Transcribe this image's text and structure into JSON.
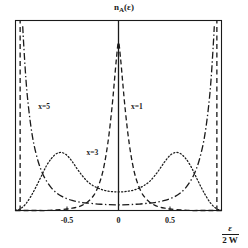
{
  "figure": {
    "title_main": "n",
    "title_sub": "A",
    "title_arg": "(ε)",
    "background_color": "#ffffff",
    "axis_color": "#1a1a1a"
  },
  "axes": {
    "xlabel_numerator": "ε",
    "xlabel_denominator": "2 W",
    "xtick_labels": [
      "-0.5",
      "0",
      "0.5"
    ],
    "xtick_values": [
      -0.5,
      0,
      0.5
    ],
    "ylabel": ""
  },
  "curve_labels": [
    {
      "text": "x=5",
      "id": "label-x5"
    },
    {
      "text": "x=3",
      "id": "label-x3"
    },
    {
      "text": "x=1",
      "id": "label-x1"
    }
  ],
  "chart_data": {
    "type": "line",
    "xlabel": "ε / 2W",
    "ylabel": "n_A(ε)",
    "xlim": [
      -1.0,
      1.0
    ],
    "ylim": [
      0,
      1.0
    ],
    "xticks": [
      -0.5,
      0,
      0.5
    ],
    "xtick_labels": [
      "-0.5",
      "0",
      "0.5"
    ],
    "grid": false,
    "legend": "inline-annotations",
    "annotations": [
      {
        "text": "x=5",
        "x": -0.78,
        "y": 0.545
      },
      {
        "text": "x=3",
        "x": -0.31,
        "y": 0.305
      },
      {
        "text": "x=1",
        "x": 0.12,
        "y": 0.545
      }
    ],
    "series": [
      {
        "name": "x=1",
        "linestyle": "dashed",
        "color": "#1a1a1a",
        "description": "Sharp single central peak at epsilon=0, cusp-like, decaying rapidly to near zero by |x|>0.35",
        "x": [
          -1.0,
          -0.9,
          -0.8,
          -0.7,
          -0.6,
          -0.5,
          -0.45,
          -0.4,
          -0.35,
          -0.3,
          -0.26,
          -0.22,
          -0.18,
          -0.15,
          -0.12,
          -0.09,
          -0.06,
          -0.04,
          -0.02,
          0.0,
          0.02,
          0.04,
          0.06,
          0.09,
          0.12,
          0.15,
          0.18,
          0.22,
          0.26,
          0.3,
          0.35,
          0.4,
          0.45,
          0.5,
          0.6,
          0.7,
          0.8,
          0.9,
          1.0
        ],
        "y": [
          0.0,
          0.0,
          0.0,
          0.0,
          0.003,
          0.008,
          0.012,
          0.018,
          0.028,
          0.045,
          0.066,
          0.098,
          0.152,
          0.21,
          0.295,
          0.41,
          0.56,
          0.68,
          0.8,
          0.885,
          0.8,
          0.68,
          0.56,
          0.41,
          0.295,
          0.21,
          0.152,
          0.098,
          0.066,
          0.045,
          0.028,
          0.018,
          0.012,
          0.008,
          0.003,
          0.0,
          0.0,
          0.0,
          0.0
        ]
      },
      {
        "name": "x=3",
        "linestyle": "dotted",
        "color": "#1a1a1a",
        "description": "Two symmetric broad humps peaking near epsilon/2W = +/-0.55 with a shallow dip at center",
        "x": [
          -1.0,
          -0.95,
          -0.9,
          -0.85,
          -0.8,
          -0.75,
          -0.7,
          -0.65,
          -0.6,
          -0.55,
          -0.5,
          -0.45,
          -0.4,
          -0.35,
          -0.3,
          -0.25,
          -0.2,
          -0.15,
          -0.1,
          -0.05,
          0.0,
          0.05,
          0.1,
          0.15,
          0.2,
          0.25,
          0.3,
          0.35,
          0.4,
          0.45,
          0.5,
          0.55,
          0.6,
          0.65,
          0.7,
          0.75,
          0.8,
          0.85,
          0.9,
          0.95,
          1.0
        ],
        "y": [
          0.0,
          0.01,
          0.035,
          0.075,
          0.125,
          0.18,
          0.235,
          0.275,
          0.3,
          0.305,
          0.29,
          0.258,
          0.218,
          0.182,
          0.152,
          0.132,
          0.118,
          0.108,
          0.102,
          0.099,
          0.098,
          0.099,
          0.102,
          0.108,
          0.118,
          0.132,
          0.152,
          0.182,
          0.218,
          0.258,
          0.29,
          0.305,
          0.3,
          0.275,
          0.235,
          0.18,
          0.125,
          0.075,
          0.035,
          0.01,
          0.0
        ]
      },
      {
        "name": "x=5",
        "linestyle": "dashdot",
        "color": "#1a1a1a",
        "description": "Diverges at the band edges near epsilon/2W = +/-0.93, falls steeply and stays low and nearly flat across the center",
        "x": [
          -0.93,
          -0.92,
          -0.9,
          -0.88,
          -0.85,
          -0.82,
          -0.78,
          -0.74,
          -0.7,
          -0.65,
          -0.6,
          -0.55,
          -0.5,
          -0.45,
          -0.4,
          -0.35,
          -0.3,
          -0.2,
          -0.1,
          0.0,
          0.1,
          0.2,
          0.3,
          0.35,
          0.4,
          0.45,
          0.5,
          0.55,
          0.6,
          0.65,
          0.7,
          0.74,
          0.78,
          0.82,
          0.85,
          0.88,
          0.9,
          0.92,
          0.93
        ],
        "y": [
          0.97,
          0.87,
          0.7,
          0.575,
          0.44,
          0.345,
          0.258,
          0.198,
          0.156,
          0.118,
          0.092,
          0.074,
          0.062,
          0.053,
          0.047,
          0.042,
          0.039,
          0.034,
          0.031,
          0.03,
          0.031,
          0.034,
          0.039,
          0.042,
          0.047,
          0.053,
          0.062,
          0.074,
          0.092,
          0.118,
          0.156,
          0.198,
          0.258,
          0.345,
          0.44,
          0.575,
          0.7,
          0.87,
          0.97
        ]
      },
      {
        "name": "x=5-edge-left",
        "linestyle": "dashed-vertical",
        "color": "#1a1a1a",
        "description": "Near-vertical dashed band-edge line on the far left of the frame",
        "x": [
          -0.955,
          -0.955
        ],
        "y": [
          0.0,
          1.0
        ]
      },
      {
        "name": "x=5-edge-right",
        "linestyle": "dashed-vertical",
        "color": "#1a1a1a",
        "description": "Near-vertical dashed band-edge line on the far right of the frame",
        "x": [
          0.955,
          0.955
        ],
        "y": [
          0.0,
          1.0
        ]
      },
      {
        "name": "center-axis",
        "linestyle": "solid",
        "color": "#1a1a1a",
        "description": "Solid vertical reference line at epsilon = 0",
        "x": [
          0.0,
          0.0
        ],
        "y": [
          0.0,
          1.0
        ]
      }
    ]
  }
}
